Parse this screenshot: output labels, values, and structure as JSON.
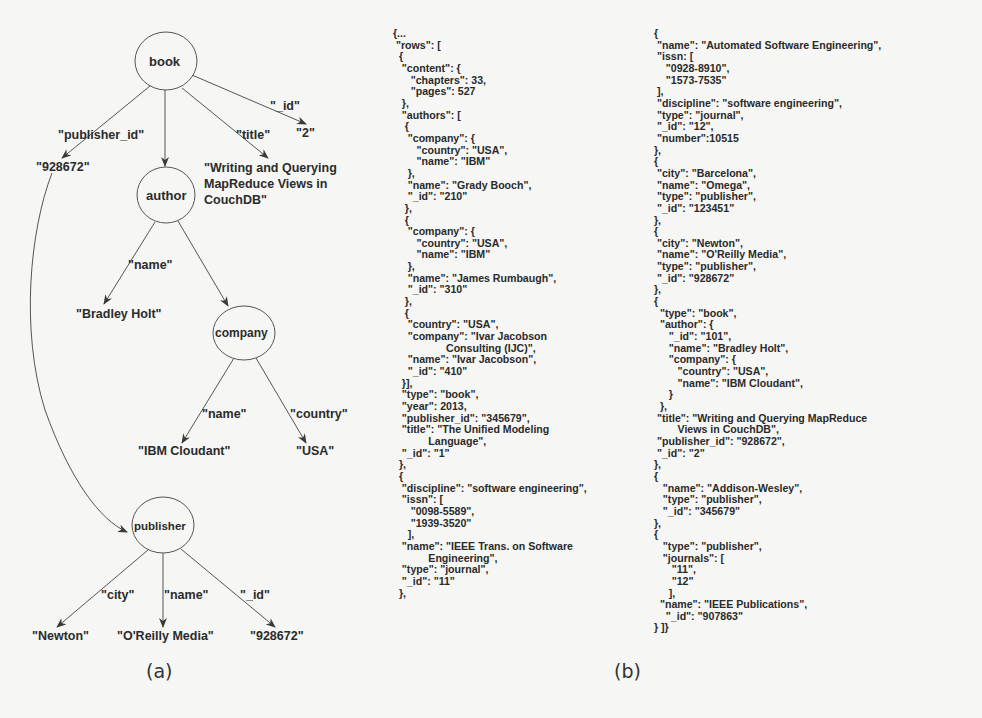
{
  "figure": {
    "caption_a": "(a)",
    "caption_b": "(b)"
  },
  "tree": {
    "nodes": {
      "book": "book",
      "author": "author",
      "company": "company",
      "publisher": "publisher"
    },
    "edges": {
      "book_publisher_id": "\"publisher_id\"",
      "book_title": "\"title\"",
      "book_id": "\"_id\"",
      "author_name": "\"name\"",
      "company_name": "\"name\"",
      "company_country": "\"country\"",
      "publisher_city": "\"city\"",
      "publisher_name": "\"name\"",
      "publisher_id": "\"_id\""
    },
    "values": {
      "publisher_id": "\"928672\"",
      "book_id": "\"2\"",
      "title": "\"Writing and Querying\nMapReduce Views in\nCouchDB\"",
      "author_name": "\"Bradley Holt\"",
      "company_name": "\"IBM Cloudant\"",
      "company_country": "\"USA\"",
      "publisher_city": "\"Newton\"",
      "publisher_name": "\"O'Reilly Media\"",
      "publisher_id_value": "\"928672\""
    }
  },
  "json_listing": {
    "column_1": "{...\n \"rows\": [\n  {\n   \"content\": {\n      \"chapters\": 33,\n      \"pages\": 527\n   },\n   \"authors\": [\n    {\n     \"company\": {\n        \"country\": \"USA\",\n        \"name\": \"IBM\"\n     },\n     \"name\": \"Grady Booch\",\n     \"_id\": \"210\"\n    },\n    {\n     \"company\": {\n        \"country\": \"USA\",\n        \"name\": \"IBM\"\n     },\n     \"name\": \"James Rumbaugh\",\n     \"_id\": \"310\"\n    },\n    {\n     \"country\": \"USA\",\n     \"company\": \"Ivar Jacobson\n                  Consulting (IJC)\",\n     \"name\": \"Ivar Jacobson\",\n     \"_id\": \"410\"\n   }],\n   \"type\": \"book\",\n   \"year\": 2013,\n   \"publisher_id\": \"345679\",\n   \"title\": \"The Unified Modeling\n            Language\",\n   \"_id\": \"1\"\n  },\n  {\n   \"discipline\": \"software engineering\",\n   \"issn\": [\n      \"0098-5589\",\n      \"1939-3520\"\n     ],\n   \"name\": \"IEEE Trans. on Software\n            Engineering\",\n   \"type\": \"journal\",\n   \"_id\": \"11\"\n  },",
    "column_2": "{\n \"name\": \"Automated Software Engineering\",\n \"issn: [\n    \"0928-8910\",\n    \"1573-7535\"\n ],\n \"discipline\": \"software engineering\",\n \"type\": \"journal\",\n \"_id\": \"12\",\n \"number\":10515\n},\n{\n \"city\": \"Barcelona\",\n \"name\": \"Omega\",\n \"type\": \"publisher\",\n \"_id\": \"123451\"\n},\n{\n \"city\": \"Newton\",\n \"name\": \"O'Reilly Media\",\n \"type\": \"publisher\",\n \"_id\": \"928672\"\n},\n{\n  \"type\": \"book\",\n  \"author\": {\n     \"_id\": \"101\",\n     \"name\": \"Bradley Holt\",\n     \"company\": {\n        \"country\": \"USA\",\n        \"name\": \"IBM Cloudant\",\n     }\n  },\n \"title\": \"Writing and Querying MapReduce\n        Views in CouchDB\",\n \"publisher_id\": \"928672\",\n \"_id\": \"2\"\n},\n{\n   \"name\": \"Addison-Wesley\",\n   \"type\": \"publisher\",\n   \"_id\": \"345679\"\n},\n{\n   \"type\": \"publisher\",\n   \"journals\": [\n      \"11\",\n      \"12\"\n     ],\n  \"name\": \"IEEE Publications\",\n    \"_id\": \"907863\"\n} ]}"
  },
  "colors": {
    "background": "#f6f6f4",
    "ink": "#2b2b2b",
    "line": "#555555"
  }
}
